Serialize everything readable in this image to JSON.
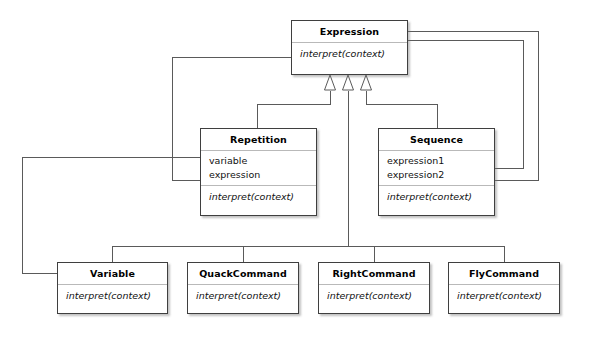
{
  "diagram": {
    "type": "uml-class-diagram",
    "background_color": "#ffffff",
    "line_color": "#4a4a4a",
    "border_color": "#3f3f3f",
    "separator_color": "#b9b9b9"
  },
  "classes": [
    {
      "id": "expression",
      "name": "Expression",
      "attributes": [],
      "operations": [
        "interpret(context)"
      ],
      "x": 291,
      "y": 20,
      "w": 117,
      "h": 55
    },
    {
      "id": "repetition",
      "name": "Repetition",
      "attributes": [
        "variable",
        "expression"
      ],
      "operations": [
        "interpret(context)"
      ],
      "x": 200,
      "y": 128,
      "w": 117,
      "h": 88
    },
    {
      "id": "sequence",
      "name": "Sequence",
      "attributes": [
        "expression1",
        "expression2"
      ],
      "operations": [
        "interpret(context)"
      ],
      "x": 378,
      "y": 128,
      "w": 117,
      "h": 88
    },
    {
      "id": "variable",
      "name": "Variable",
      "attributes": [],
      "operations": [
        "interpret(context)"
      ],
      "x": 57,
      "y": 262,
      "w": 111,
      "h": 52
    },
    {
      "id": "quackcommand",
      "name": "QuackCommand",
      "attributes": [],
      "operations": [
        "interpret(context)"
      ],
      "x": 187,
      "y": 262,
      "w": 112,
      "h": 52
    },
    {
      "id": "rightcommand",
      "name": "RightCommand",
      "attributes": [],
      "operations": [
        "interpret(context)"
      ],
      "x": 318,
      "y": 262,
      "w": 112,
      "h": 52
    },
    {
      "id": "flycommand",
      "name": "FlyCommand",
      "attributes": [],
      "operations": [
        "interpret(context)"
      ],
      "x": 448,
      "y": 262,
      "w": 112,
      "h": 52
    }
  ],
  "generalizations": [
    {
      "from": "repetition",
      "to": "expression",
      "arrow": "hollow-triangle"
    },
    {
      "from": "sequence",
      "to": "expression",
      "arrow": "hollow-triangle"
    },
    {
      "from": "variable",
      "to": "expression",
      "arrow": "hollow-triangle"
    },
    {
      "from": "quackcommand",
      "to": "expression",
      "arrow": "hollow-triangle"
    },
    {
      "from": "rightcommand",
      "to": "expression",
      "arrow": "hollow-triangle"
    },
    {
      "from": "flycommand",
      "to": "expression",
      "arrow": "hollow-triangle"
    }
  ],
  "associations": [
    {
      "from": "repetition",
      "from_member": "expression",
      "to": "expression"
    },
    {
      "from": "repetition",
      "from_member": "variable",
      "to": "variable"
    },
    {
      "from": "sequence",
      "from_member": "expression1",
      "to": "expression"
    },
    {
      "from": "sequence",
      "from_member": "expression2",
      "to": "expression"
    }
  ]
}
